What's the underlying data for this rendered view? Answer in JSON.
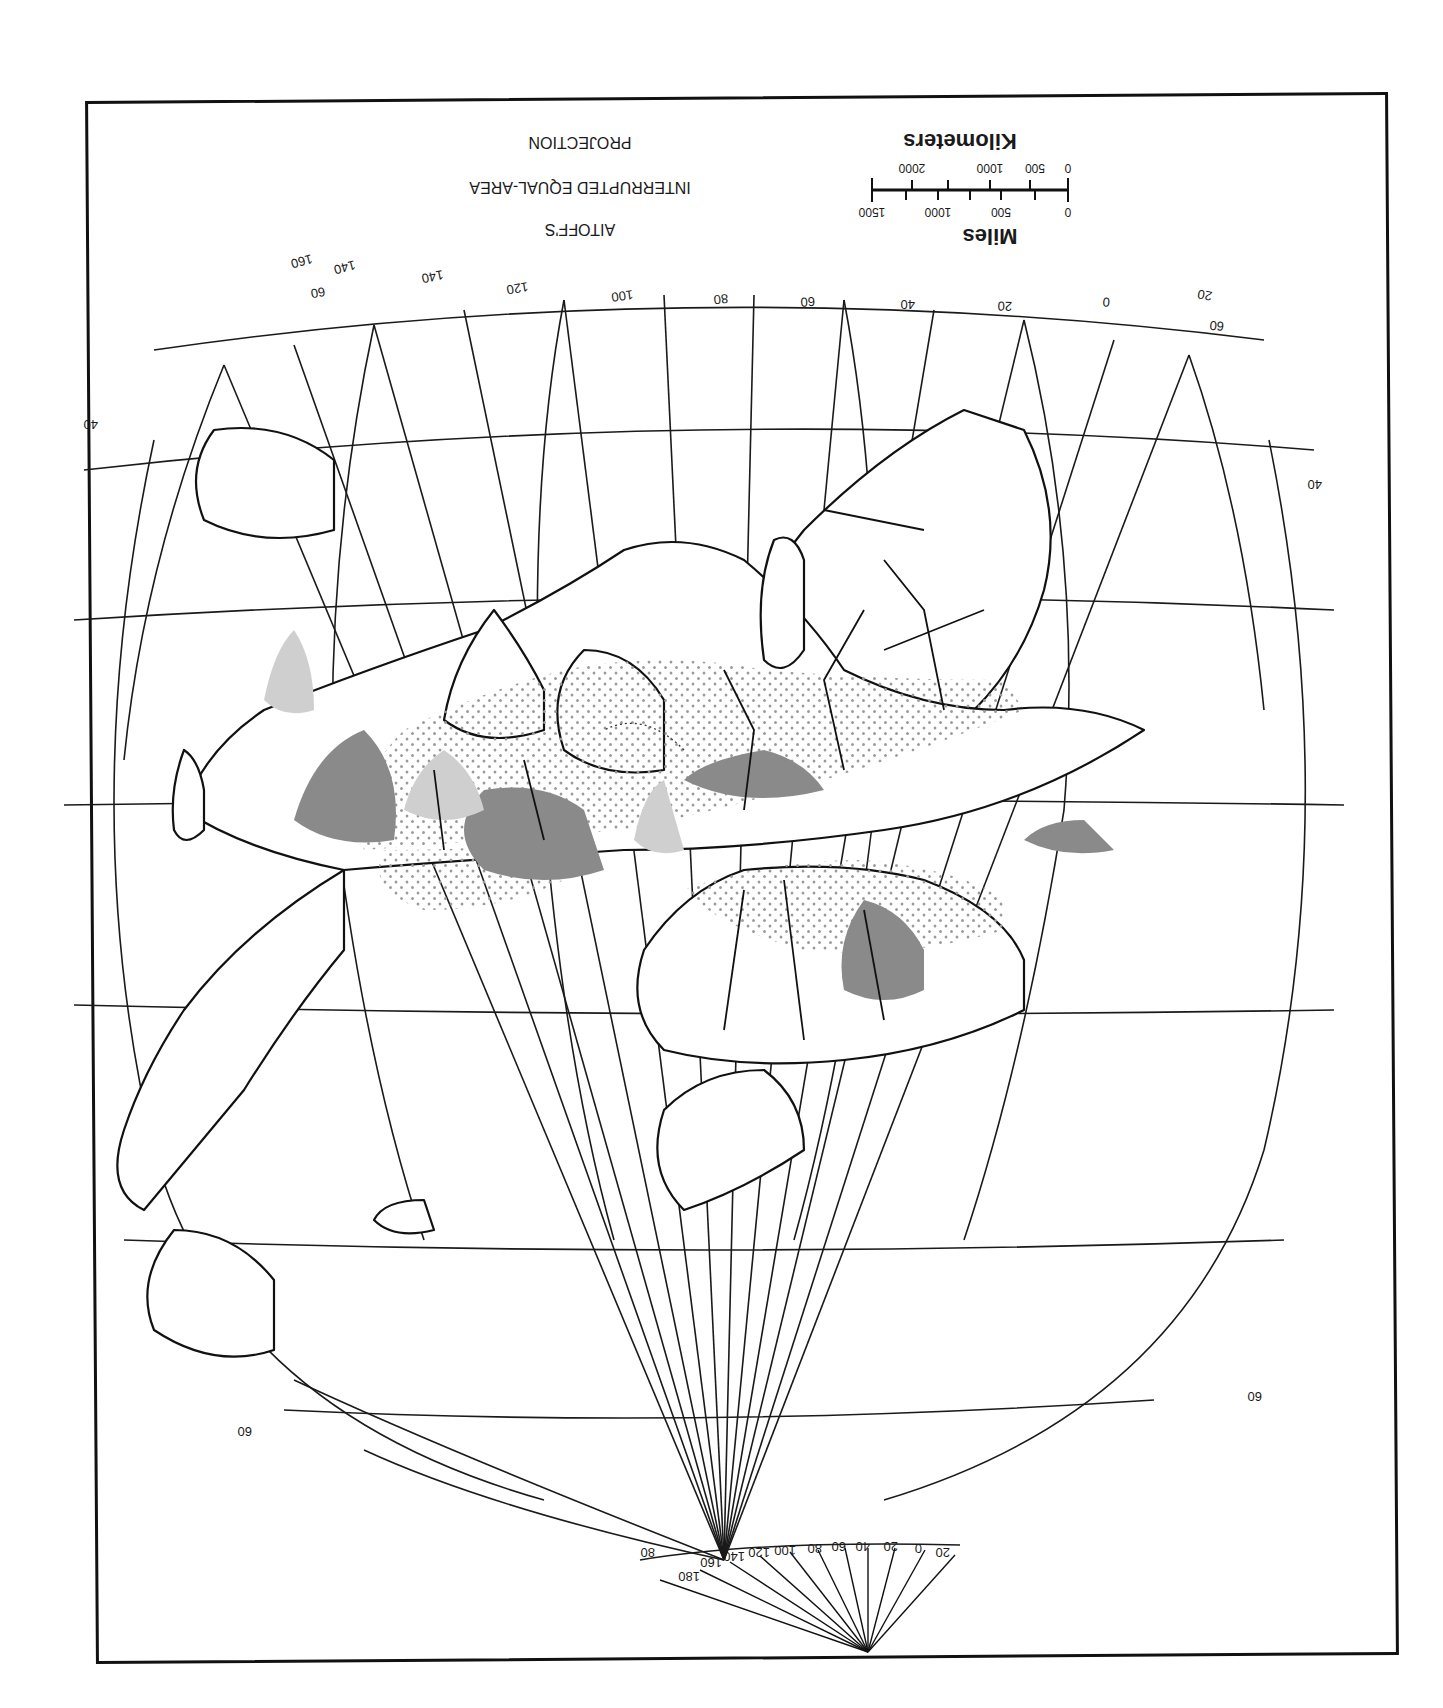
{
  "map": {
    "orientation": "rotated-180",
    "title_lines": [
      "AITOFF'S",
      "INTERRUPTED EQUAL-AREA",
      "PROJECTION"
    ],
    "scale": {
      "miles_label": "Miles",
      "miles_ticks": [
        "0",
        "500",
        "1000",
        "1500"
      ],
      "km_label": "Kilometers",
      "km_ticks": [
        "0",
        "500",
        "1000",
        "2000"
      ]
    },
    "meridian_labels_top": [
      "160",
      "140",
      "120",
      "100",
      "80",
      "60",
      "40",
      "20",
      "0",
      "20"
    ],
    "meridian_labels_bottom": [
      "180",
      "160",
      "140",
      "120",
      "100",
      "80",
      "60",
      "40",
      "20",
      "0",
      "20"
    ],
    "parallel_labels": {
      "top_left": "60",
      "top_right": "60",
      "upper_left": "40",
      "upper_right": "40",
      "lower_left": "60",
      "lower_right": "60",
      "bottom_left": "80"
    },
    "colors": {
      "frame": "#111111",
      "background": "#ffffff",
      "dark_shade": "#8a8a8a",
      "light_shade": "#cfcfcf",
      "dot_pattern": "#9a9a9a"
    },
    "legend_shading": [
      "dark-gray-shaded",
      "light-gray-shaded",
      "dot-stippled"
    ]
  }
}
